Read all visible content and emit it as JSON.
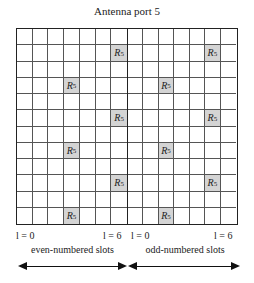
{
  "title": "Antenna port 5",
  "grid": {
    "rows": 12,
    "cols_per_slot": 7,
    "shade_color": "#d4d4d4",
    "ref_symbol": "R",
    "ref_subscript": "5",
    "even_slot_refs": [
      {
        "row": 1,
        "col": 6
      },
      {
        "row": 3,
        "col": 3
      },
      {
        "row": 5,
        "col": 6
      },
      {
        "row": 7,
        "col": 3
      },
      {
        "row": 9,
        "col": 6
      },
      {
        "row": 11,
        "col": 3
      }
    ],
    "odd_slot_refs": [
      {
        "row": 1,
        "col": 5
      },
      {
        "row": 3,
        "col": 2
      },
      {
        "row": 5,
        "col": 5
      },
      {
        "row": 7,
        "col": 2
      },
      {
        "row": 9,
        "col": 5
      },
      {
        "row": 11,
        "col": 2
      }
    ]
  },
  "axis": {
    "even_start": "l = 0",
    "even_end": "l = 6",
    "odd_start": "l = 0",
    "odd_end": "l = 6"
  },
  "slots": {
    "even_label": "even-numbered slots",
    "odd_label": "odd-numbered slots"
  }
}
